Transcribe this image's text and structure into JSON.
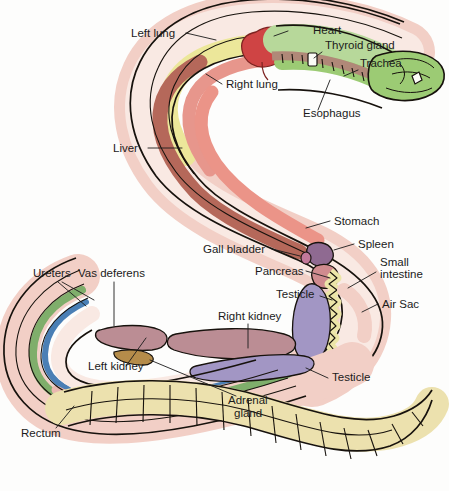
{
  "figure": {
    "background_color": "#fdfdfc",
    "outline_color": "#17120d",
    "label_color": "#1b1b1b"
  },
  "labels": [
    {
      "id": "left-lung",
      "text": "Left lung",
      "x": 131,
      "y": 37,
      "anchor": "start"
    },
    {
      "id": "heart",
      "text": "Heart",
      "x": 313,
      "y": 34,
      "anchor": "start"
    },
    {
      "id": "thyroid-gland",
      "text": "Thyroid gland",
      "x": 325,
      "y": 49,
      "anchor": "start"
    },
    {
      "id": "trachea",
      "text": "Trachea",
      "x": 360,
      "y": 67,
      "anchor": "start"
    },
    {
      "id": "right-lung",
      "text": "Right lung",
      "x": 226,
      "y": 88,
      "anchor": "start"
    },
    {
      "id": "esophagus",
      "text": "Esophagus",
      "x": 303,
      "y": 117,
      "anchor": "start"
    },
    {
      "id": "liver",
      "text": "Liver",
      "x": 113,
      "y": 152,
      "anchor": "start"
    },
    {
      "id": "stomach",
      "text": "Stomach",
      "x": 334,
      "y": 225,
      "anchor": "start"
    },
    {
      "id": "gall-bladder",
      "text": "Gall bladder",
      "x": 203,
      "y": 253,
      "anchor": "start"
    },
    {
      "id": "spleen",
      "text": "Spleen",
      "x": 358,
      "y": 248,
      "anchor": "start"
    },
    {
      "id": "pancreas",
      "text": "Pancreas",
      "x": 255,
      "y": 275,
      "anchor": "start"
    },
    {
      "id": "small-intestine-1",
      "text": "Small",
      "x": 380,
      "y": 266,
      "anchor": "start"
    },
    {
      "id": "small-intestine-2",
      "text": "intestine",
      "x": 380,
      "y": 278,
      "anchor": "start"
    },
    {
      "id": "ureters",
      "text": "Ureters",
      "x": 33,
      "y": 277,
      "anchor": "start"
    },
    {
      "id": "vas-deferens",
      "text": "Vas deferens",
      "x": 78,
      "y": 277,
      "anchor": "start"
    },
    {
      "id": "testicle-top",
      "text": "Testicle",
      "x": 276,
      "y": 298,
      "anchor": "start"
    },
    {
      "id": "air-sac",
      "text": "Air Sac",
      "x": 382,
      "y": 308,
      "anchor": "start"
    },
    {
      "id": "right-kidney",
      "text": "Right kidney",
      "x": 218,
      "y": 320,
      "anchor": "start"
    },
    {
      "id": "left-kidney",
      "text": "Left kidney",
      "x": 88,
      "y": 370,
      "anchor": "start"
    },
    {
      "id": "testicle-bottom",
      "text": "Testicle",
      "x": 332,
      "y": 381,
      "anchor": "start"
    },
    {
      "id": "adrenal-gland-1",
      "text": "Adrenal",
      "x": 228,
      "y": 404,
      "anchor": "start"
    },
    {
      "id": "adrenal-gland-2",
      "text": "gland",
      "x": 234,
      "y": 417,
      "anchor": "start"
    },
    {
      "id": "rectum",
      "text": "Rectum",
      "x": 21,
      "y": 437,
      "anchor": "start"
    }
  ],
  "colors": {
    "body_fill": "#f6ded8",
    "skin_pink": "#f2cfc6",
    "lung_left_yellow": "#ece79a",
    "lung_right_salmon": "#e7968c",
    "liver_brown": "#b5685a",
    "stomach_salmon": "#eb9488",
    "heart_red": "#cf4444",
    "head_green": "#9ccb74",
    "trachea_green": "#b7d89a",
    "esophagus_brown": "#b08878",
    "spleen_purple": "#8f6a91",
    "pancreas_pink": "#d08b8f",
    "intestine_yellow": "#ece5a8",
    "testicle_purple": "#a296c4",
    "kidney_mauve": "#bb8d94",
    "adrenal_tan": "#b58c4a",
    "ureter_blue": "#4a7fb5",
    "vas_green": "#7fae6b",
    "tail_cream": "#ece1ae",
    "rectum_pink": "#e9b8b0"
  }
}
